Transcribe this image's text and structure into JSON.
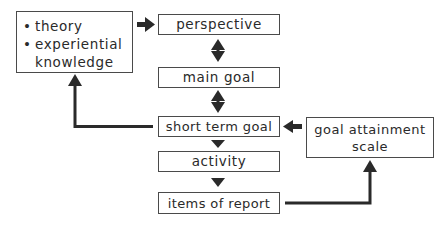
{
  "diagram": {
    "nodes": {
      "sources": {
        "items": [
          "theory",
          "experiential",
          "knowledge"
        ],
        "bullets": [
          "•",
          "•",
          ""
        ]
      },
      "perspective": {
        "label": "perspective"
      },
      "main_goal": {
        "label": "main goal"
      },
      "short_term_goal": {
        "label": "short term goal"
      },
      "activity": {
        "label": "activity"
      },
      "items_of_report": {
        "label": "items of report"
      },
      "goal_attainment_scale": {
        "line1": "goal attainment",
        "line2": "scale"
      }
    },
    "edges": [
      {
        "from": "sources",
        "to": "perspective",
        "type": "arrow"
      },
      {
        "from": "perspective",
        "to": "main_goal",
        "type": "bidirectional"
      },
      {
        "from": "main_goal",
        "to": "short_term_goal",
        "type": "bidirectional"
      },
      {
        "from": "short_term_goal",
        "to": "activity",
        "type": "arrow"
      },
      {
        "from": "activity",
        "to": "items_of_report",
        "type": "arrow"
      },
      {
        "from": "short_term_goal",
        "to": "sources",
        "type": "elbow-arrow"
      },
      {
        "from": "goal_attainment_scale",
        "to": "short_term_goal",
        "type": "arrow"
      },
      {
        "from": "items_of_report",
        "to": "goal_attainment_scale",
        "type": "elbow-arrow"
      }
    ],
    "colors": {
      "stroke": "#2a2a2a",
      "box_border": "#4a4a4a",
      "background": "#ffffff"
    }
  }
}
